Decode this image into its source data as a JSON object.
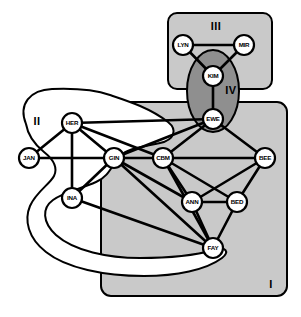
{
  "diagram": {
    "type": "node-link-diagram",
    "canvas": {
      "width": 301,
      "height": 317
    },
    "colors": {
      "background": "#ffffff",
      "stroke": "#000000",
      "region_light_fill": "#c9c9c9",
      "region_white_fill": "#ffffff",
      "region_dark_fill": "#8f8f8f",
      "node_fill": "#ffffff",
      "node_stroke": "#000000",
      "label_color": "#000000"
    },
    "regions": [
      {
        "id": "I",
        "label": "I",
        "shape": "rounded-rect",
        "fill": "#c9c9c9",
        "label_x": 271,
        "label_y": 288,
        "x": 101,
        "y": 102,
        "w": 186,
        "h": 194,
        "r": 10
      },
      {
        "id": "II",
        "label": "II",
        "shape": "blob",
        "fill": "#ffffff",
        "label_x": 37,
        "label_y": 125,
        "path": "M 26 124 C 18 104 30 90 52 89 C 78 88 96 90 110 95 C 128 101 150 108 168 122 C 178 130 174 140 160 143 C 142 147 128 148 120 156 C 112 164 110 176 96 182 C 80 189 64 192 53 200 C 42 208 42 222 56 235 C 74 251 108 258 140 258 C 176 258 200 254 214 250 C 226 246 230 252 222 258 C 206 270 176 276 144 276 C 104 276 66 268 46 252 C 28 238 24 220 30 206 C 36 192 50 184 54 176 C 58 168 54 160 44 152 C 34 144 28 136 26 124 Z"
      },
      {
        "id": "III",
        "label": "III",
        "shape": "rounded-rect",
        "fill": "#c9c9c9",
        "label_x": 216,
        "label_y": 30,
        "x": 168,
        "y": 13,
        "w": 104,
        "h": 76,
        "r": 9
      },
      {
        "id": "IV",
        "label": "IV",
        "shape": "ellipse",
        "fill": "#8f8f8f",
        "label_x": 231,
        "label_y": 94,
        "cx": 213,
        "cy": 91,
        "rx": 26,
        "ry": 41
      }
    ],
    "nodes": [
      {
        "id": "LYN",
        "label": "LYN",
        "x": 183,
        "y": 45,
        "r": 10
      },
      {
        "id": "MIR",
        "label": "MIR",
        "x": 244,
        "y": 45,
        "r": 10
      },
      {
        "id": "KIM",
        "label": "KIM",
        "x": 213,
        "y": 76,
        "r": 10
      },
      {
        "id": "EWE",
        "label": "EWE",
        "x": 213,
        "y": 119,
        "r": 10
      },
      {
        "id": "HER",
        "label": "HER",
        "x": 72,
        "y": 123,
        "r": 10
      },
      {
        "id": "JAN",
        "label": "JAN",
        "x": 29,
        "y": 158,
        "r": 10
      },
      {
        "id": "GIN",
        "label": "GIN",
        "x": 114,
        "y": 158,
        "r": 10
      },
      {
        "id": "CBM",
        "label": "CBM",
        "x": 163,
        "y": 158,
        "r": 10
      },
      {
        "id": "BEE",
        "label": "BEE",
        "x": 265,
        "y": 158,
        "r": 10
      },
      {
        "id": "INA",
        "label": "INA",
        "x": 72,
        "y": 198,
        "r": 10
      },
      {
        "id": "ANN",
        "label": "ANN",
        "x": 192,
        "y": 202,
        "r": 10
      },
      {
        "id": "BED",
        "label": "BED",
        "x": 237,
        "y": 202,
        "r": 10
      },
      {
        "id": "FAY",
        "label": "FAY",
        "x": 213,
        "y": 248,
        "r": 10
      }
    ],
    "edges": [
      {
        "from": "LYN",
        "to": "MIR"
      },
      {
        "from": "LYN",
        "to": "KIM"
      },
      {
        "from": "MIR",
        "to": "KIM"
      },
      {
        "from": "KIM",
        "to": "EWE"
      },
      {
        "from": "EWE",
        "to": "CBM"
      },
      {
        "from": "EWE",
        "to": "GIN"
      },
      {
        "from": "EWE",
        "to": "HER"
      },
      {
        "from": "EWE",
        "to": "BEE"
      },
      {
        "from": "HER",
        "to": "JAN"
      },
      {
        "from": "HER",
        "to": "INA"
      },
      {
        "from": "HER",
        "to": "GIN"
      },
      {
        "from": "HER",
        "to": "CBM"
      },
      {
        "from": "JAN",
        "to": "GIN"
      },
      {
        "from": "INA",
        "to": "GIN"
      },
      {
        "from": "INA",
        "to": "FAY"
      },
      {
        "from": "GIN",
        "to": "CBM"
      },
      {
        "from": "GIN",
        "to": "ANN"
      },
      {
        "from": "GIN",
        "to": "FAY"
      },
      {
        "from": "CBM",
        "to": "BEE"
      },
      {
        "from": "CBM",
        "to": "ANN"
      },
      {
        "from": "CBM",
        "to": "BED"
      },
      {
        "from": "CBM",
        "to": "FAY"
      },
      {
        "from": "BEE",
        "to": "ANN"
      },
      {
        "from": "BEE",
        "to": "BED"
      },
      {
        "from": "ANN",
        "to": "BED"
      },
      {
        "from": "ANN",
        "to": "FAY"
      },
      {
        "from": "BED",
        "to": "FAY"
      }
    ]
  }
}
